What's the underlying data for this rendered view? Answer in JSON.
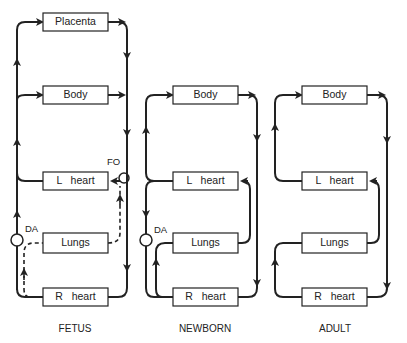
{
  "panels": [
    {
      "caption": "FETUS",
      "boxes": {
        "placenta": "Placenta",
        "body": "Body",
        "lheart": "L   heart",
        "lungs": "Lungs",
        "rheart": "R   heart"
      },
      "annotations": {
        "fo": "FO",
        "da": "DA"
      }
    },
    {
      "caption": "NEWBORN",
      "boxes": {
        "body": "Body",
        "lheart": "L   heart",
        "lungs": "Lungs",
        "rheart": "R   heart"
      },
      "annotations": {
        "da": "DA"
      }
    },
    {
      "caption": "ADULT",
      "boxes": {
        "body": "Body",
        "lheart": "L   heart",
        "lungs": "Lungs",
        "rheart": "R   heart"
      }
    }
  ],
  "colors": {
    "line": "#222222",
    "background": "#ffffff"
  }
}
